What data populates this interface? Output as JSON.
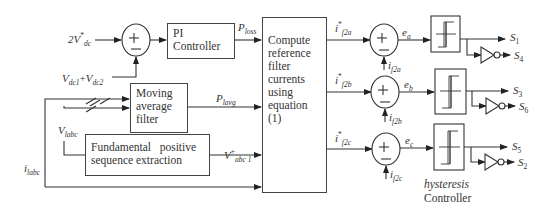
{
  "inputs": {
    "vdc_ref": "2V",
    "vdc_ref_sub": "dc",
    "vdc_ref_sup": "*",
    "vdc_meas_a": "V",
    "vdc_meas_a_sub": "dc1",
    "vdc_meas_plus": "+",
    "vdc_meas_b": "V",
    "vdc_meas_b_sub": "dc2",
    "vlabc": "V",
    "vlabc_sub": "labc",
    "ilabc": "i",
    "ilabc_sub": "labc"
  },
  "blocks": {
    "pi_controller": "PI Controller",
    "moving_average": "Moving average filter",
    "fundamental": "Fundamental   positive sequence extraction",
    "compute": "Compute reference filter currents using equation (1)",
    "hysteresis_label_1": "hysteresis",
    "hysteresis_label_2": "Controller"
  },
  "signals": {
    "ploss": "P",
    "ploss_sub": "loss",
    "plavg": "P",
    "plavg_sub": "lavg",
    "vabc1": "V",
    "vabc1_sub": "abc 1",
    "vabc1_sup": "+",
    "ref_a": "i",
    "ref_a_sub": "f2a",
    "ref_b": "i",
    "ref_b_sub": "f2b",
    "ref_c": "i",
    "ref_c_sub": "f2c",
    "ref_sup": "*",
    "ea": "e",
    "ea_sub": "a",
    "eb": "e",
    "eb_sub": "b",
    "ec": "e",
    "ec_sub": "c",
    "fb_a": "i",
    "fb_a_sub": "f2a",
    "fb_b": "i",
    "fb_b_sub": "f2b",
    "fb_c": "i",
    "fb_c_sub": "f2c"
  },
  "outputs": {
    "s1": "S",
    "s1_sub": "1",
    "s4": "S",
    "s4_sub": "4",
    "s3": "S",
    "s3_sub": "3",
    "s6": "S",
    "s6_sub": "6",
    "s5": "S",
    "s5_sub": "5",
    "s2": "S",
    "s2_sub": "2"
  },
  "summing_junction": {
    "plus": "+",
    "minus": "−"
  }
}
